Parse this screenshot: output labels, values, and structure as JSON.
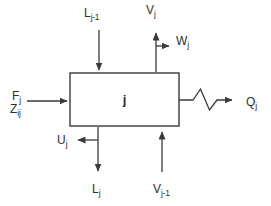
{
  "diagram": {
    "stage_label": "j",
    "streams": {
      "liquid_in_top": {
        "main": "L",
        "sub": "j-1"
      },
      "vapor_out_top": {
        "main": "V",
        "sub": "j"
      },
      "vapor_sidestream": {
        "main": "W",
        "sub": "j"
      },
      "feed_flow": {
        "main": "F",
        "sub": "j"
      },
      "feed_composition": {
        "main": "Z",
        "sub": "ij"
      },
      "heat_duty": {
        "main": "Q",
        "sub": "j"
      },
      "liquid_sidestream": {
        "main": "U",
        "sub": "j"
      },
      "liquid_out_bottom": {
        "main": "L",
        "sub": "j"
      },
      "vapor_in_bottom": {
        "main": "V",
        "sub": "j-1"
      }
    },
    "icons": {
      "heat_symbol": "zigzag-heat-transfer-icon",
      "arrowhead": "filled-triangle-arrowhead"
    },
    "colors": {
      "line": "#3a3a3a",
      "text": "#2f2f2f",
      "background": "#ffffff"
    }
  }
}
